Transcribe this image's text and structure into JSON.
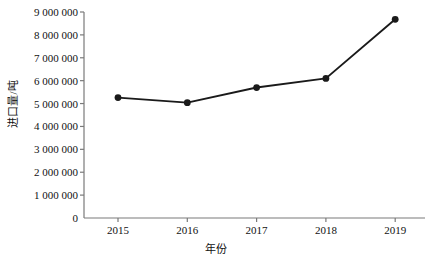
{
  "chart_data": {
    "type": "line",
    "title": "",
    "xlabel": "年份",
    "ylabel": "进口量/吨",
    "categories": [
      "2015",
      "2016",
      "2017",
      "2018",
      "2019"
    ],
    "values": [
      5260000,
      5040000,
      5700000,
      6100000,
      8680000
    ],
    "series": [
      {
        "name": "进口量",
        "values": [
          5260000,
          5040000,
          5700000,
          6100000,
          8680000
        ]
      }
    ],
    "ylim": [
      0,
      9000000
    ],
    "ytick_values": [
      0,
      1000000,
      2000000,
      3000000,
      4000000,
      5000000,
      6000000,
      7000000,
      8000000,
      9000000
    ],
    "ytick_labels": [
      "0",
      "1 000 000",
      "2 000 000",
      "3 000 000",
      "4 000 000",
      "5 000 000",
      "6 000 000",
      "7 000 000",
      "8 000 000",
      "9 000 000"
    ],
    "xtick_labels": [
      "2015",
      "2016",
      "2017",
      "2018",
      "2019"
    ],
    "grid": false,
    "legend": false,
    "legend_position": "none",
    "marker": "filled-circle",
    "line_color": "#1a1a1a",
    "marker_color": "#1a1a1a",
    "axis_color": "#7a7a7a",
    "background_color": "#ffffff"
  }
}
